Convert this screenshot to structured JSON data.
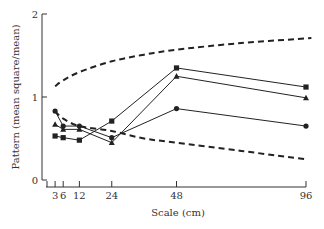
{
  "chart_data": {
    "type": "line",
    "title": "",
    "xlabel": "Scale (cm)",
    "ylabel": "Pattern (mean square/mean)",
    "x": [
      3,
      6,
      12,
      24,
      48,
      96
    ],
    "x_ticks": [
      "3",
      "6",
      "12",
      "24",
      "48",
      "96"
    ],
    "y_ticks": [
      "0",
      "1",
      "2"
    ],
    "xlim": [
      0,
      96
    ],
    "ylim": [
      0,
      2
    ],
    "grid": false,
    "legend": "none",
    "series": [
      {
        "name": "circle-series",
        "marker": "circle",
        "style": "solid",
        "values": [
          0.83,
          0.65,
          0.65,
          0.51,
          0.86,
          0.65
        ]
      },
      {
        "name": "triangle-series",
        "marker": "triangle",
        "style": "solid",
        "values": [
          0.67,
          0.61,
          0.61,
          0.45,
          1.25,
          0.99
        ]
      },
      {
        "name": "square-series",
        "marker": "square",
        "style": "solid",
        "values": [
          0.53,
          0.51,
          0.48,
          0.71,
          1.35,
          1.12
        ]
      },
      {
        "name": "upper-bound",
        "marker": "none",
        "style": "dashed",
        "x": [
          3,
          6,
          12,
          24,
          36,
          48,
          72,
          98
        ],
        "values": [
          1.13,
          1.2,
          1.3,
          1.43,
          1.51,
          1.57,
          1.65,
          1.71
        ]
      },
      {
        "name": "lower-bound",
        "marker": "none",
        "style": "dashed",
        "x": [
          3,
          6,
          12,
          24,
          36,
          48,
          72,
          96
        ],
        "values": [
          0.83,
          0.74,
          0.65,
          0.59,
          0.5,
          0.45,
          0.35,
          0.25
        ]
      }
    ]
  }
}
